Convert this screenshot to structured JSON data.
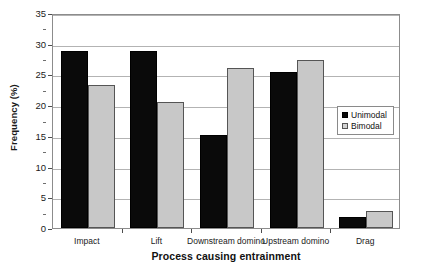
{
  "chart_data": {
    "type": "bar",
    "title": "",
    "xlabel": "Process causing entrainment",
    "ylabel": "Frequency (%)",
    "categories": [
      "Impact",
      "Lift",
      "Downstream domino",
      "Upstream domino",
      "Drag"
    ],
    "series": [
      {
        "name": "Unimodal",
        "color": "#000000",
        "values": [
          28.8,
          28.8,
          15.1,
          25.4,
          1.8
        ]
      },
      {
        "name": "Bimodal",
        "color": "#c8c8c8",
        "values": [
          23.3,
          20.5,
          26.1,
          27.4,
          2.8
        ]
      }
    ],
    "ylim": [
      0,
      35
    ],
    "ytick_values": [
      0,
      5,
      10,
      15,
      20,
      25,
      30,
      35
    ],
    "ytick_labels": [
      "0",
      "5",
      "10",
      "15",
      "20",
      "25",
      "30",
      "35"
    ],
    "yminor_values": [
      2.5,
      7.5,
      12.5,
      17.5,
      22.5,
      27.5,
      32.5
    ],
    "grid": "horizontal",
    "legend_position": "inside-right"
  },
  "legend": {
    "entries": [
      {
        "label": "Unimodal",
        "swatch": "black-square"
      },
      {
        "label": "Bimodal",
        "swatch": "gray-square"
      }
    ]
  }
}
